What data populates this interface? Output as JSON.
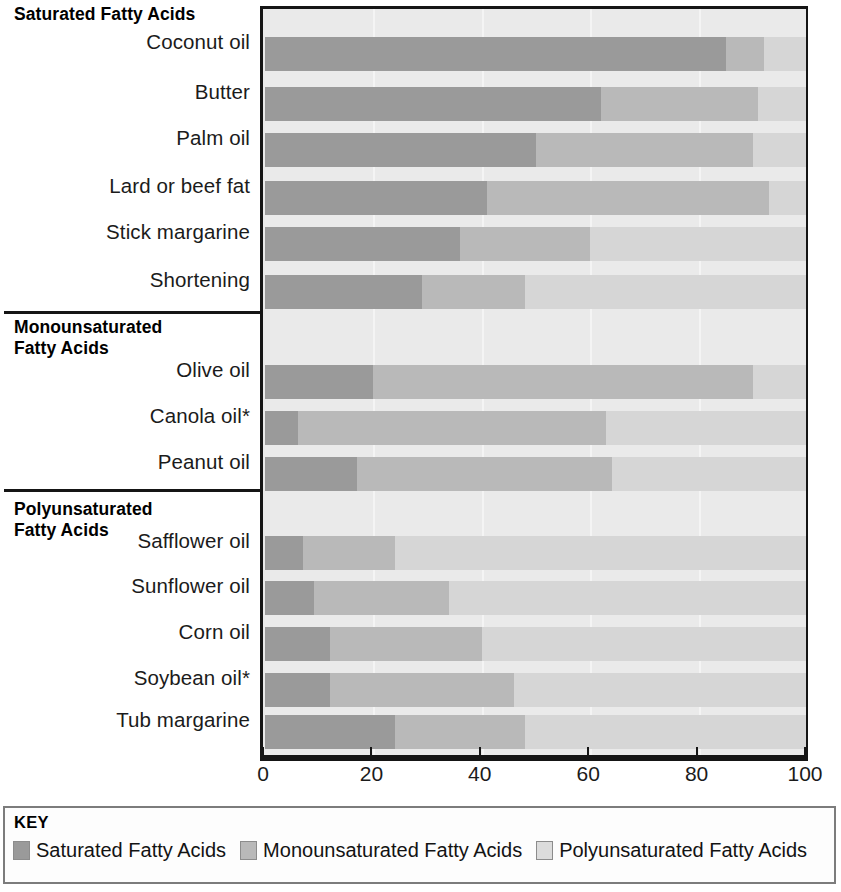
{
  "chart_data": {
    "type": "bar",
    "orientation": "horizontal",
    "stacked": true,
    "title": "",
    "xlabel": "",
    "ylabel": "",
    "xlim": [
      0,
      100
    ],
    "xticks": [
      0,
      20,
      40,
      60,
      80,
      100
    ],
    "xtick_labels": [
      "0",
      "20",
      "40",
      "60",
      "80",
      "100"
    ],
    "grid": true,
    "legend_position": "bottom",
    "legend_title": "KEY",
    "series": [
      {
        "name": "Saturated Fatty Acids",
        "key": "sat",
        "color": "#9a9a9a"
      },
      {
        "name": "Monounsaturated Fatty Acids",
        "key": "mono",
        "color": "#b9b9b9"
      },
      {
        "name": "Polyunsaturated Fatty Acids",
        "key": "poly",
        "color": "#d6d6d6"
      }
    ],
    "groups": [
      {
        "label": "Saturated Fatty Acids",
        "categories": [
          "Coconut oil",
          "Butter",
          "Palm oil",
          "Lard or beef fat",
          "Stick margarine",
          "Shortening"
        ],
        "saturated": [
          85,
          62,
          50,
          41,
          36,
          29
        ],
        "monounsaturated": [
          7,
          29,
          40,
          52,
          24,
          19
        ],
        "polyunsaturated": [
          8,
          9,
          10,
          7,
          40,
          52
        ]
      },
      {
        "label": "Monounsaturated\nFatty Acids",
        "categories": [
          "Olive oil",
          "Canola oil*",
          "Peanut oil"
        ],
        "saturated": [
          20,
          6,
          17
        ],
        "monounsaturated": [
          70,
          57,
          47
        ],
        "polyunsaturated": [
          10,
          37,
          36
        ]
      },
      {
        "label": "Polyunsaturated\nFatty Acids",
        "categories": [
          "Safflower oil",
          "Sunflower oil",
          "Corn oil",
          "Soybean oil*",
          "Tub margarine"
        ],
        "saturated": [
          7,
          9,
          12,
          12,
          24
        ],
        "monounsaturated": [
          17,
          25,
          28,
          34,
          24
        ],
        "polyunsaturated": [
          76,
          66,
          60,
          54,
          52
        ]
      }
    ]
  },
  "axis": {
    "ticks": [
      {
        "value": 0,
        "label": "0"
      },
      {
        "value": 20,
        "label": "20"
      },
      {
        "value": 40,
        "label": "40"
      },
      {
        "value": 60,
        "label": "60"
      },
      {
        "value": 80,
        "label": "80"
      },
      {
        "value": 100,
        "label": "100"
      }
    ]
  },
  "key": {
    "title": "KEY",
    "items": [
      {
        "swatch": "sat",
        "label": "Saturated Fatty Acids"
      },
      {
        "swatch": "mono",
        "label": "Monounsaturated Fatty Acids"
      },
      {
        "swatch": "poly",
        "label": "Polyunsaturated Fatty Acids"
      }
    ]
  },
  "colors": {
    "saturated": "#9a9a9a",
    "monounsaturated": "#b9b9b9",
    "polyunsaturated": "#d6d6d6",
    "plot_background": "#eaeaea",
    "frame": "#151515"
  }
}
